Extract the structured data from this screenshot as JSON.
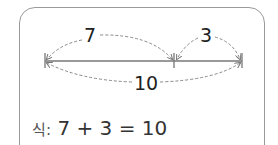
{
  "diagram": {
    "part1_label": "7",
    "part2_label": "3",
    "total_label": "10"
  },
  "equation": {
    "prefix": "식:",
    "expression": "7 + 3 = 10"
  }
}
